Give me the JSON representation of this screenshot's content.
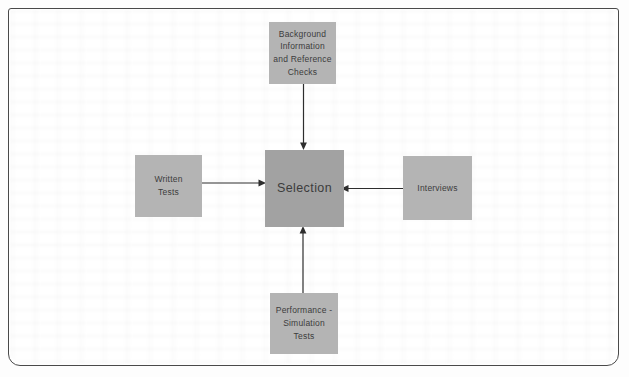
{
  "diagram": {
    "center_node": {
      "id": "selection",
      "label": "Selection"
    },
    "nodes": [
      {
        "id": "background-reference-checks",
        "label": "Background\nInformation\nand Reference\nChecks",
        "position": "top"
      },
      {
        "id": "written-tests",
        "label": "Written\nTests",
        "position": "left"
      },
      {
        "id": "interviews",
        "label": "Interviews",
        "position": "right"
      },
      {
        "id": "performance-simulation-tests",
        "label": "Performance -\nSimulation\nTests",
        "position": "bottom"
      }
    ],
    "edges": [
      {
        "from": "background-reference-checks",
        "to": "selection",
        "direction": "down"
      },
      {
        "from": "written-tests",
        "to": "selection",
        "direction": "right"
      },
      {
        "from": "interviews",
        "to": "selection",
        "direction": "left"
      },
      {
        "from": "performance-simulation-tests",
        "to": "selection",
        "direction": "up"
      }
    ],
    "colors": {
      "node_fill": "#b4b4b4",
      "center_node_fill": "#a2a2a2",
      "node_text": "#3c3c3c",
      "arrow": "#2e2e2e",
      "frame_border": "#4a4a4a",
      "page_background": "#ffffff"
    }
  }
}
